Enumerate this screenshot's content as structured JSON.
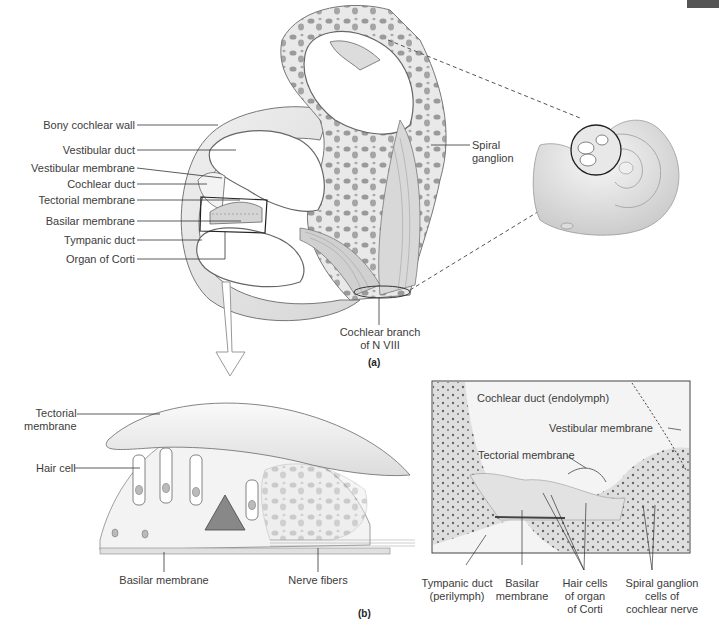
{
  "figure": {
    "panel_a": {
      "tag": "(a)",
      "labels_left": [
        {
          "text": "Bony cochlear wall"
        },
        {
          "text": "Vestibular duct"
        },
        {
          "text": "Vestibular membrane"
        },
        {
          "text": "Cochlear duct"
        },
        {
          "text": "Tectorial membrane"
        },
        {
          "text": "Basilar membrane"
        },
        {
          "text": "Tympanic duct"
        },
        {
          "text": "Organ of Corti"
        }
      ],
      "spiral_ganglion": {
        "line1": "Spiral",
        "line2": "ganglion"
      },
      "cochlear_branch": {
        "line1": "Cochlear branch",
        "line2": "of N VIII"
      }
    },
    "panel_b": {
      "tag": "(b)",
      "drawing_labels": {
        "tectorial": {
          "line1": "Tectorial",
          "line2": "membrane"
        },
        "hair_cell": "Hair cell",
        "basilar": "Basilar membrane",
        "nerve_fibers": "Nerve fibers"
      },
      "micrograph_labels": {
        "cochlear_duct": "Cochlear duct (endolymph)",
        "vestibular_membrane": "Vestibular membrane",
        "tectorial_membrane": "Tectorial membrane",
        "tympanic": {
          "line1": "Tympanic duct",
          "line2": "(perilymph)"
        },
        "basilar": {
          "line1": "Basilar",
          "line2": "membrane"
        },
        "hair_cells": {
          "line1": "Hair cells",
          "line2": "of organ",
          "line3": "of Corti"
        },
        "spiral_ganglion": {
          "line1": "Spiral ganglion",
          "line2": "cells of",
          "line3": "cochlear nerve"
        }
      }
    },
    "colors": {
      "bone": "#e6e6e6",
      "bone_dark": "#bdbdbd",
      "line": "#333333",
      "micrograph_bg": "#ececec",
      "tissue": "#cfcfcf",
      "nuclei": "#555555"
    }
  }
}
